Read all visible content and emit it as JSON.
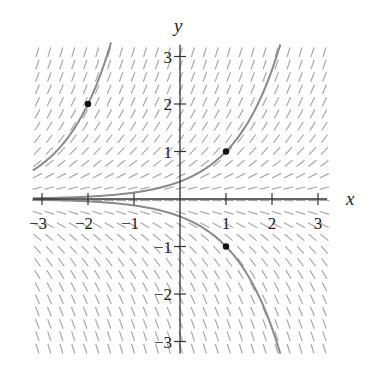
{
  "diagram": {
    "equation": "dy/dx = y",
    "axes": {
      "x_label": "x",
      "y_label": "y",
      "x_ticks": [
        -3,
        -2,
        -1,
        1,
        2,
        3
      ],
      "y_ticks": [
        -3,
        -2,
        -1,
        1,
        2,
        3
      ],
      "x_tick_labels": [
        "−3",
        "−2",
        "−1",
        "1",
        "2",
        "3"
      ],
      "y_tick_labels": [
        "−3",
        "−2",
        "−1",
        "1",
        "2",
        "3"
      ],
      "xlim": [
        -3.2,
        3.2
      ],
      "ylim": [
        -3.2,
        3.2
      ]
    },
    "field": {
      "x_range": [
        -3.2,
        3.2
      ],
      "y_range": [
        -3.2,
        3.2
      ],
      "step": 0.26,
      "segment_length": 0.2,
      "color": "#a8a8a8"
    },
    "solution_curves": [
      {
        "label": "y = 2e^(x+2)",
        "through": [
          -2,
          2
        ],
        "C": 14.778,
        "color": "#8a8a8a"
      },
      {
        "label": "y = e^(x-1)",
        "through": [
          1,
          1
        ],
        "C": 0.3679,
        "color": "#8a8a8a"
      },
      {
        "label": "y = -e^(x-1)",
        "through": [
          1,
          -1
        ],
        "C": -0.3679,
        "color": "#8a8a8a"
      }
    ],
    "points": [
      {
        "x": -2,
        "y": 2
      },
      {
        "x": 1,
        "y": 1
      },
      {
        "x": 1,
        "y": -1
      }
    ],
    "colors": {
      "axis": "#333333",
      "point": "#111111",
      "text": "#222222"
    }
  }
}
